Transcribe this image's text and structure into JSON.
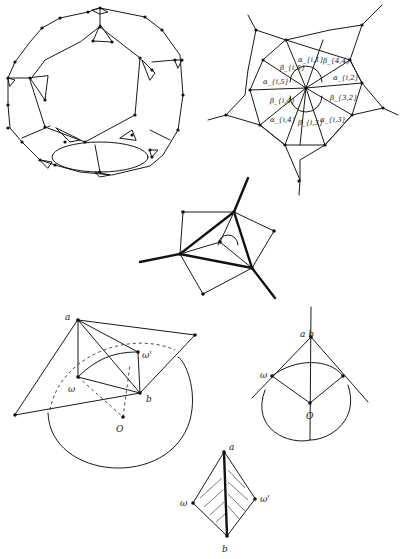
{
  "figures": {
    "truncated_polyhedron": {
      "label": "truncated-dodecahedron-like graph"
    },
    "pentagon": {
      "alphas": [
        "α_{i,1}",
        "α_{i,2}",
        "α_{i,3}",
        "α_{i,4}",
        "α_{i,5}"
      ],
      "betas": [
        "β_{i,5}",
        "β_{4,4}",
        "β_{3,2}",
        "β_{i,3}",
        "β_{i,4}"
      ]
    },
    "quad": {
      "label": "vertex configuration with angle marks"
    },
    "circle_figure": {
      "a": "a",
      "b": "b",
      "w": "ω",
      "w2": "ω'",
      "o": "O"
    },
    "right_figure": {
      "ab": "a b",
      "w": "ω",
      "o": "O"
    },
    "kite": {
      "a": "a",
      "b": "b",
      "w": "ω",
      "w2": "ω'"
    }
  }
}
